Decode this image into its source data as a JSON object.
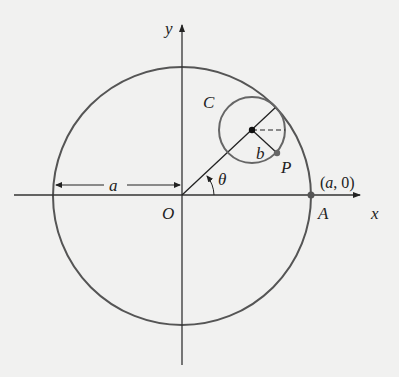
{
  "diagram": {
    "title": "",
    "labels": {
      "y_axis": "y",
      "x_axis": "x",
      "origin": "O",
      "radius_a": "a",
      "theta": "θ",
      "small_circle": "C",
      "small_radius": "b",
      "point_p": "P",
      "point_a": "A",
      "point_a_coords_open": "(",
      "point_a_coords_a": "a",
      "point_a_coords_rest": ", 0)"
    },
    "colors": {
      "background": "#f1f1f0",
      "big_circle": "#555555",
      "small_circle": "#666666",
      "axes": "#333333",
      "point": "#555555"
    }
  }
}
